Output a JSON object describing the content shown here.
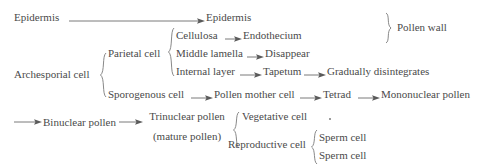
{
  "diagram": {
    "type": "flowchart",
    "background_color": "#ffffff",
    "text_color": "#4a4a4a",
    "connector_color": "#6b6b6b"
  },
  "nodes": {
    "epidermis_source": "Epidermis",
    "epidermis_target": "Epidermis",
    "pollen_wall": "Pollen wall",
    "archesporial_cell": "Archesporial cell",
    "parietal_cell": "Parietal cell",
    "cellulosa": "Cellulosa",
    "endothecium": "Endothecium",
    "middle_lamella": "Middle lamella",
    "disappear": "Disappear",
    "internal_layer": "Internal layer",
    "tapetum": "Tapetum",
    "gradually_disintegrates": "Gradually disintegrates",
    "sporogenous_cell": "Sporogenous cell",
    "pollen_mother_cell": "Pollen mother cell",
    "tetrad": "Tetrad",
    "mononuclear_pollen": "Mononuclear pollen",
    "binuclear_pollen": "Binuclear pollen",
    "trinuclear_pollen_line1": "Trinuclear pollen",
    "trinuclear_pollen_line2": "(mature pollen)",
    "vegetative_cell": "Vegetative cell",
    "reproductive_cell": "Reproductive cell",
    "sperm_cell_1": "Sperm cell",
    "sperm_cell_2": "Sperm cell"
  },
  "connectors": [
    {
      "name": "epidermis-to-epidermis",
      "from": "epidermis_source",
      "to": "epidermis_target"
    },
    {
      "name": "cellulosa-to-endothecium",
      "from": "cellulosa",
      "to": "endothecium"
    },
    {
      "name": "middle-lamella-to-disappear",
      "from": "middle_lamella",
      "to": "disappear"
    },
    {
      "name": "internal-layer-to-tapetum",
      "from": "internal_layer",
      "to": "tapetum"
    },
    {
      "name": "tapetum-to-gradually-disintegrates",
      "from": "tapetum",
      "to": "gradually_disintegrates"
    },
    {
      "name": "sporogenous-to-pollen-mother-cell",
      "from": "sporogenous_cell",
      "to": "pollen_mother_cell"
    },
    {
      "name": "pollen-mother-cell-to-tetrad",
      "from": "pollen_mother_cell",
      "to": "tetrad"
    },
    {
      "name": "tetrad-to-mononuclear-pollen",
      "from": "tetrad",
      "to": "mononuclear_pollen"
    },
    {
      "name": "wrap-to-binuclear-pollen",
      "from": "mononuclear_pollen",
      "to": "binuclear_pollen"
    },
    {
      "name": "binuclear-to-trinuclear-pollen",
      "from": "binuclear_pollen",
      "to": "trinuclear_pollen_line1"
    }
  ],
  "braces": [
    {
      "name": "pollen-wall-brace",
      "groups": [
        "epidermis_target",
        "endothecium"
      ],
      "label": "pollen_wall"
    },
    {
      "name": "archesporial-cell-brace",
      "groups": [
        "parietal_cell",
        "sporogenous_cell"
      ],
      "label": "archesporial_cell"
    },
    {
      "name": "parietal-cell-brace",
      "groups": [
        "cellulosa",
        "middle_lamella",
        "internal_layer"
      ],
      "label": "parietal_cell"
    },
    {
      "name": "trinuclear-pollen-brace",
      "groups": [
        "vegetative_cell",
        "reproductive_cell"
      ],
      "label": "trinuclear_pollen_line1"
    },
    {
      "name": "reproductive-cell-brace",
      "groups": [
        "sperm_cell_1",
        "sperm_cell_2"
      ],
      "label": "reproductive_cell"
    }
  ]
}
